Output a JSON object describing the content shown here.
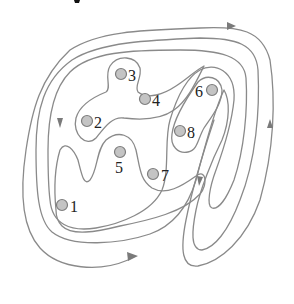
{
  "diagram": {
    "type": "nested-contour-graph",
    "colors": {
      "contour": "#8a8a8a",
      "node_fill": "#c4c4c4",
      "node_stroke": "#7d7d7d",
      "label": "#222222",
      "arrow": "#7a7a7a"
    },
    "nodes": [
      {
        "id": "1",
        "label": "1",
        "x": 62,
        "y": 205
      },
      {
        "id": "2",
        "label": "2",
        "x": 87,
        "y": 121
      },
      {
        "id": "3",
        "label": "3",
        "x": 121,
        "y": 74
      },
      {
        "id": "4",
        "label": "4",
        "x": 145,
        "y": 99
      },
      {
        "id": "5",
        "label": "5",
        "x": 120,
        "y": 152
      },
      {
        "id": "6",
        "label": "6",
        "x": 212,
        "y": 90
      },
      {
        "id": "7",
        "label": "7",
        "x": 153,
        "y": 174
      },
      {
        "id": "8",
        "label": "8",
        "x": 180,
        "y": 131
      }
    ],
    "arrows": [
      {
        "name": "arrow-top-right",
        "direction": "right",
        "x": 233,
        "y": 26
      },
      {
        "name": "arrow-left-down",
        "direction": "down",
        "x": 60,
        "y": 122
      },
      {
        "name": "arrow-bottom-right",
        "direction": "right",
        "x": 133,
        "y": 256
      },
      {
        "name": "arrow-right-up",
        "direction": "up",
        "x": 270,
        "y": 124
      },
      {
        "name": "arrow-center-down",
        "direction": "down",
        "x": 200,
        "y": 180
      }
    ]
  }
}
